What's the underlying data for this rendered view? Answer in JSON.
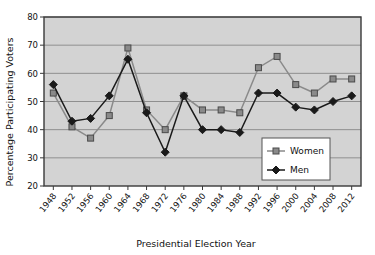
{
  "chart_data": {
    "type": "line",
    "title": "",
    "xlabel": "Presidential Election Year",
    "ylabel": "Percentage Participating Voters",
    "categories": [
      "1948",
      "1952",
      "1956",
      "1960",
      "1964",
      "1968",
      "1972",
      "1976",
      "1980",
      "1984",
      "1988",
      "1992",
      "1996",
      "2000",
      "2004",
      "2008",
      "2012"
    ],
    "x": [
      1948,
      1952,
      1956,
      1960,
      1964,
      1968,
      1972,
      1976,
      1980,
      1984,
      1988,
      1992,
      1996,
      2000,
      2004,
      2008,
      2012
    ],
    "ylim": [
      20,
      80
    ],
    "yticks": [
      20,
      30,
      40,
      50,
      60,
      70,
      80
    ],
    "grid": true,
    "legend_position": "bottom-right",
    "series": [
      {
        "name": "Women",
        "color": "#8a8a8a",
        "marker": "square",
        "values": [
          53,
          41,
          37,
          45,
          69,
          47,
          40,
          52,
          47,
          47,
          46,
          62,
          66,
          56,
          53,
          58,
          58
        ]
      },
      {
        "name": "Men",
        "color": "#1a1a1a",
        "marker": "diamond",
        "values": [
          56,
          43,
          44,
          52,
          65,
          46,
          32,
          52,
          40,
          40,
          39,
          53,
          53,
          48,
          47,
          50,
          52
        ]
      }
    ]
  },
  "legend": {
    "items": [
      {
        "label": "Women"
      },
      {
        "label": "Men"
      }
    ]
  },
  "axes": {
    "y_title": "Percentage Participating Voters",
    "x_title": "Presidential Election Year",
    "y_tick_labels": [
      "80",
      "70",
      "60",
      "50",
      "40",
      "30",
      "20"
    ],
    "x_tick_labels": [
      "1948",
      "1952",
      "1956",
      "1960",
      "1964",
      "1968",
      "1972",
      "1976",
      "1980",
      "1984",
      "1988",
      "1992",
      "1996",
      "2000",
      "2004",
      "2008",
      "2012"
    ]
  },
  "style": {
    "plot_background": "#d3d3d3",
    "grid_color": "#8f8f8f",
    "frame_color": "#3a3a3a",
    "page_background": "#ffffff",
    "women_color": "#8a8a8a",
    "men_color": "#1a1a1a"
  }
}
